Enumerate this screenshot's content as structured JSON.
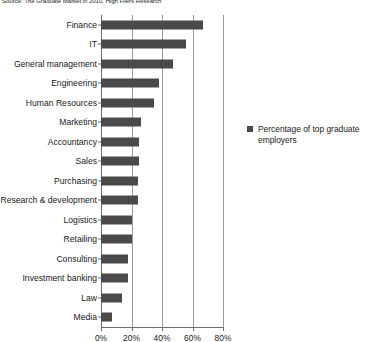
{
  "source_note": "Source: The Graduate Market in 2010, High Fliers Research",
  "legend": {
    "marker": "legend-square",
    "label": "Percentage of top graduate employers"
  },
  "axis": {
    "ticks": [
      "0%",
      "20%",
      "40%",
      "60%",
      "80%"
    ]
  },
  "chart_data": {
    "type": "bar",
    "orientation": "horizontal",
    "title": "",
    "subtitle": "",
    "xlabel": "",
    "ylabel": "",
    "xlim": [
      0,
      80
    ],
    "grid": true,
    "legend_position": "right",
    "series_name": "Percentage of top graduate employers",
    "bar_color": "#4a4a4a",
    "categories": [
      "Finance",
      "IT",
      "General management",
      "Engineering",
      "Human Resources",
      "Marketing",
      "Accountancy",
      "Sales",
      "Purchasing",
      "Research & development",
      "Logistics",
      "Retailing",
      "Consulting",
      "Investment banking",
      "Law",
      "Media"
    ],
    "values": [
      67,
      56,
      47,
      38,
      35,
      26,
      25,
      25,
      24,
      24,
      20,
      20,
      18,
      18,
      14,
      7
    ],
    "tick_values": [
      0,
      20,
      40,
      60,
      80
    ],
    "tick_labels": [
      "0%",
      "20%",
      "40%",
      "60%",
      "80%"
    ]
  }
}
